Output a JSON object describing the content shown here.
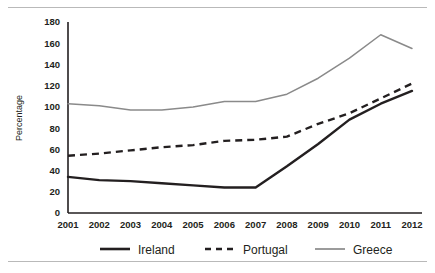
{
  "chart_data": {
    "type": "line",
    "title": "",
    "subtitle": "",
    "xlabel": "",
    "ylabel": "Percentage",
    "categories": [
      "2001",
      "2002",
      "2003",
      "2004",
      "2005",
      "2006",
      "2007",
      "2008",
      "2009",
      "2010",
      "2011",
      "2012"
    ],
    "x": [
      2001,
      2002,
      2003,
      2004,
      2005,
      2006,
      2007,
      2008,
      2009,
      2010,
      2011,
      2012
    ],
    "xlim": [
      2001,
      2012
    ],
    "ylim": [
      0,
      180
    ],
    "yticks": [
      0,
      20,
      40,
      60,
      80,
      100,
      120,
      140,
      160,
      180
    ],
    "ytick_labels": [
      "0",
      "20",
      "40",
      "60",
      "80",
      "100",
      "120",
      "140",
      "160",
      "180"
    ],
    "grid": false,
    "legend_position": "bottom",
    "series": [
      {
        "name": "Ireland",
        "style": "solid",
        "color": "#231f20",
        "width": 2.4,
        "values": [
          34,
          31,
          30,
          28,
          26,
          24,
          24,
          44,
          65,
          88,
          103,
          115
        ]
      },
      {
        "name": "Portugal",
        "style": "dashed",
        "color": "#231f20",
        "width": 2.4,
        "values": [
          54,
          56,
          59,
          62,
          64,
          68,
          69,
          72,
          84,
          94,
          108,
          122
        ]
      },
      {
        "name": "Greece",
        "style": "solid",
        "color": "#8a8a8a",
        "width": 1.5,
        "values": [
          103,
          101,
          97,
          97,
          100,
          105,
          105,
          112,
          127,
          146,
          168,
          155
        ]
      }
    ]
  },
  "legend": {
    "items": [
      {
        "label": "Ireland"
      },
      {
        "label": "Portugal"
      },
      {
        "label": "Greece"
      }
    ]
  },
  "axis": {
    "y_title": "Percentage"
  }
}
